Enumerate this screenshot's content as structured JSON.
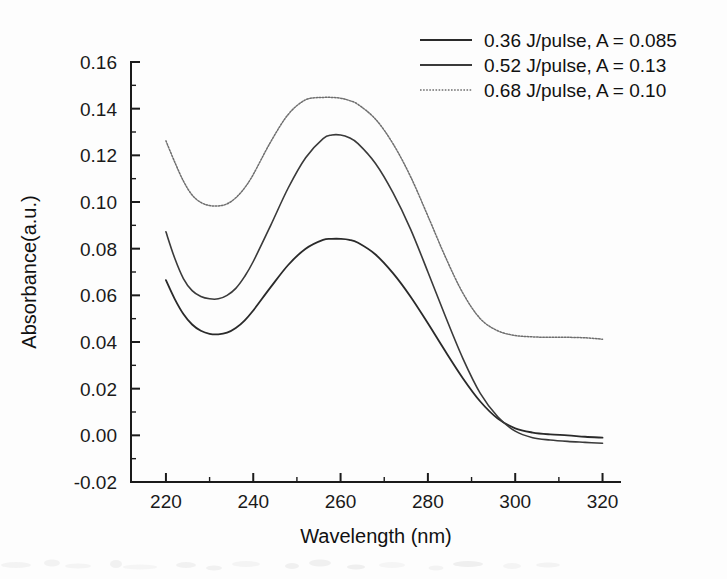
{
  "chart_data": {
    "type": "line",
    "title": "",
    "xlabel": "Wavelength (nm)",
    "ylabel": "Absorbance(a.u.)",
    "xlim": [
      212,
      324
    ],
    "ylim": [
      -0.02,
      0.16
    ],
    "xticks": [
      220,
      240,
      260,
      280,
      300,
      320
    ],
    "xtick_labels": [
      "220",
      "240",
      "260",
      "280",
      "300",
      "320"
    ],
    "yticks": [
      -0.02,
      0.0,
      0.02,
      0.04,
      0.06,
      0.08,
      0.1,
      0.12,
      0.14,
      0.16
    ],
    "ytick_labels": [
      "-0.02",
      "0.00",
      "0.02",
      "0.04",
      "0.06",
      "0.08",
      "0.10",
      "0.12",
      "0.14",
      "0.16"
    ],
    "minor_ticks": true,
    "grid": false,
    "legend_position": "top-right",
    "axis_color": "#1b1b1b",
    "series": [
      {
        "name": "0.36 J/pulse, A = 0.085",
        "legend_label": "0.36 J/pulse, A = 0.085",
        "style": "solid",
        "color": "#2a2a2a",
        "width": 1.8,
        "x": [
          220,
          222,
          224,
          226,
          228,
          230,
          232,
          234,
          236,
          238,
          240,
          244,
          248,
          252,
          256,
          258,
          260,
          262,
          264,
          268,
          272,
          276,
          280,
          284,
          288,
          292,
          296,
          300,
          304,
          308,
          312,
          316,
          320
        ],
        "y": [
          0.0665,
          0.0585,
          0.052,
          0.0475,
          0.0448,
          0.0435,
          0.0433,
          0.044,
          0.046,
          0.0492,
          0.0535,
          0.0635,
          0.073,
          0.08,
          0.0838,
          0.0842,
          0.0842,
          0.0838,
          0.0825,
          0.0775,
          0.0695,
          0.0595,
          0.048,
          0.036,
          0.0245,
          0.0145,
          0.0072,
          0.003,
          0.0012,
          0.0004,
          0.0,
          -0.0006,
          -0.001
        ]
      },
      {
        "name": "0.52 J/pulse, A = 0.13",
        "legend_label": "0.52 J/pulse, A = 0.13",
        "style": "solid",
        "color": "#3a3a3a",
        "width": 1.6,
        "x": [
          220,
          222,
          224,
          226,
          228,
          230,
          232,
          234,
          236,
          238,
          240,
          244,
          248,
          252,
          256,
          258,
          260,
          262,
          264,
          268,
          272,
          276,
          280,
          284,
          288,
          292,
          296,
          300,
          304,
          308,
          312,
          316,
          320
        ],
        "y": [
          0.0872,
          0.076,
          0.0672,
          0.062,
          0.0595,
          0.0585,
          0.0585,
          0.06,
          0.063,
          0.068,
          0.0745,
          0.09,
          0.106,
          0.119,
          0.1272,
          0.1287,
          0.1287,
          0.1275,
          0.125,
          0.1165,
          0.104,
          0.0885,
          0.07,
          0.051,
          0.033,
          0.018,
          0.008,
          0.0018,
          -0.001,
          -0.002,
          -0.0026,
          -0.003,
          -0.0034
        ]
      },
      {
        "name": "0.68 J/pulse, A = 0.10",
        "legend_label": "0.68 J/pulse, A = 0.10",
        "style": "dotted",
        "color": "#6e6e6e",
        "width": 1.5,
        "x": [
          220,
          222,
          224,
          226,
          228,
          230,
          232,
          234,
          236,
          238,
          240,
          244,
          248,
          252,
          256,
          258,
          260,
          262,
          264,
          268,
          272,
          276,
          280,
          284,
          288,
          292,
          296,
          300,
          304,
          308,
          312,
          316,
          320
        ],
        "y": [
          0.1262,
          0.1172,
          0.109,
          0.103,
          0.0998,
          0.0985,
          0.0983,
          0.0992,
          0.1018,
          0.106,
          0.1118,
          0.1258,
          0.1375,
          0.1438,
          0.1448,
          0.1448,
          0.1445,
          0.1435,
          0.1418,
          0.1355,
          0.125,
          0.111,
          0.094,
          0.0765,
          0.061,
          0.05,
          0.0448,
          0.0428,
          0.0422,
          0.042,
          0.042,
          0.0418,
          0.0412
        ]
      }
    ]
  },
  "legend": {
    "entries": [
      {
        "label": "0.36 J/pulse, A = 0.085"
      },
      {
        "label": "0.52 J/pulse, A = 0.13"
      },
      {
        "label": "0.68 J/pulse, A = 0.10"
      }
    ]
  },
  "axes": {
    "x_title": "Wavelength (nm)",
    "y_title": "Absorbance(a.u.)"
  }
}
